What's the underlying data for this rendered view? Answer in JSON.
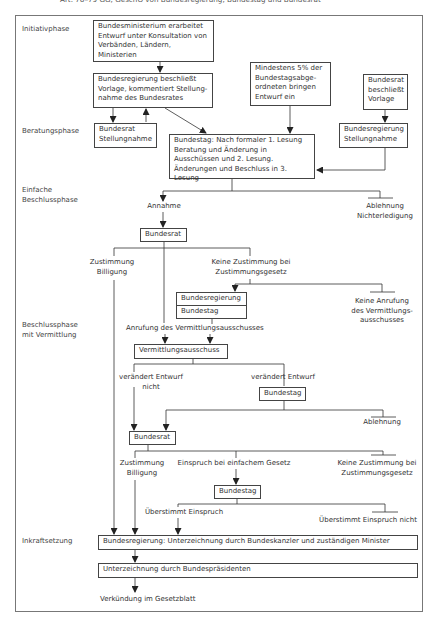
{
  "caption": "Art. 76–79 GG, GeschO von Bundesregierung, Bundestag und Bundesrat",
  "phases": {
    "initiativ": "Initiativphase",
    "beratung": "Beratungsphase",
    "einfach_1": "Einfache",
    "einfach_2": "Beschlussphase",
    "vermittlung_1": "Beschlussphase",
    "vermittlung_2": "mit Vermittlung",
    "inkraft": "Inkraftsetzung"
  },
  "boxes": {
    "ministerium": [
      "Bundesministerium erarbeitet",
      "Entwurf unter Konsultation von",
      "Verbänden, Ländern, Ministerien"
    ],
    "regierung_beschluss": [
      "Bundesregierung beschließt",
      "Vorlage, kommentiert Stellung-",
      "nahme des Bundesrates"
    ],
    "abgeordnete": [
      "Mindestens 5% der",
      "Bundestagsabge-",
      "ordneten bringen",
      "Entwurf ein"
    ],
    "bundesrat_vorlage": [
      "Bundesrat",
      "beschließt",
      "Vorlage"
    ],
    "bundesrat_stellungnahme": [
      "Bundesrat",
      "Stellungnahme"
    ],
    "bundesregierung_stellungnahme": [
      "Bundesregierung",
      "Stellungnahme"
    ],
    "bundestag_lesung": [
      "Bundestag: Nach formaler 1. Lesung",
      "Beratung und Änderung in",
      "Ausschüssen und 2. Lesung.",
      "Änderungen und Beschluss in 3. Lesung"
    ],
    "bundesrat_1": "Bundesrat",
    "bundesregierung_small": "Bundesregierung",
    "bundestag_small": "Bundestag",
    "vermittlungsausschuss": "Vermittlungsausschuss",
    "bundestag_2": "Bundestag",
    "bundesrat_2": "Bundesrat",
    "bundestag_3": "Bundestag",
    "unterzeichnung_kanzler": "Bundesregierung: Unterzeichnung durch Bundeskanzler und zuständigen Minister",
    "unterzeichnung_praesident": "Unterzeichnung durch Bundespräsidenten"
  },
  "labels": {
    "annahme": "Annahme",
    "ablehnung_1": [
      "Ablehnung",
      "Nichterledigung"
    ],
    "zustimmung_1": [
      "Zustimmung",
      "Billigung"
    ],
    "keine_zustimmung_1": [
      "Keine Zustimmung bei",
      "Zustimmungsgesetz"
    ],
    "keine_anrufung": [
      "Keine Anrufung",
      "des Vermittlungs-",
      "ausschusses"
    ],
    "anrufung": "Anrufung des Vermittlungsausschusses",
    "veraendert_nicht": [
      "verändert Entwurf",
      "nicht"
    ],
    "veraendert": "verändert Entwurf",
    "ablehnung_2": "Ablehnung",
    "zustimmung_2": [
      "Zustimmung",
      "Billigung"
    ],
    "einspruch": "Einspruch bei einfachem Gesetz",
    "keine_zustimmung_2": [
      "Keine Zustimmung bei",
      "Zustimmungsgesetz"
    ],
    "ueberstimmt": "Überstimmt Einspruch",
    "ueberstimmt_nicht": "Überstimmt Einspruch nicht",
    "verkuendung": "Verkündung im Gesetzblatt"
  },
  "colors": {
    "line": "#333333",
    "frame": "#777777",
    "text": "#333333"
  }
}
